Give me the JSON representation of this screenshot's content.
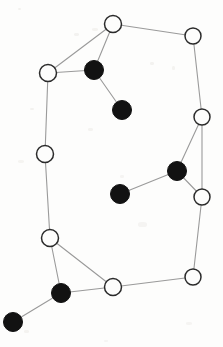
{
  "figure": {
    "title": "",
    "width": 223,
    "height": 347,
    "background_color": "#fdfdfc",
    "node_open_fill": "#fdfdfc",
    "node_open_stroke": "#2b2b2b",
    "node_filled_fill": "#121212",
    "edge_color": "#9a9a9a"
  },
  "chart_data": {
    "type": "scatter",
    "title": "",
    "subtitle": "",
    "xlabel": "",
    "ylabel": "",
    "xlim": [
      0,
      223
    ],
    "ylim": [
      0,
      347
    ],
    "grid": false,
    "legend": [
      {
        "key": "open",
        "label": "",
        "marker": "open-circle",
        "color": "#fdfdfc"
      },
      {
        "key": "filled",
        "label": "",
        "marker": "filled-circle",
        "color": "#121212"
      }
    ],
    "annotations": [],
    "nodes": [
      {
        "id": "n1",
        "label": "",
        "x": 113,
        "y": 24,
        "r": 8.5,
        "type": "open"
      },
      {
        "id": "n2",
        "label": "",
        "x": 193,
        "y": 36,
        "r": 8.0,
        "type": "open"
      },
      {
        "id": "n3",
        "label": "",
        "x": 48,
        "y": 73,
        "r": 8.5,
        "type": "open"
      },
      {
        "id": "n4",
        "label": "",
        "x": 94,
        "y": 70,
        "r": 9.5,
        "type": "filled"
      },
      {
        "id": "n5",
        "label": "",
        "x": 122,
        "y": 110,
        "r": 9.5,
        "type": "filled"
      },
      {
        "id": "n6",
        "label": "",
        "x": 202,
        "y": 117,
        "r": 8.0,
        "type": "open"
      },
      {
        "id": "n7",
        "label": "",
        "x": 45,
        "y": 154,
        "r": 8.5,
        "type": "open"
      },
      {
        "id": "n8",
        "label": "",
        "x": 177,
        "y": 171,
        "r": 9.5,
        "type": "filled"
      },
      {
        "id": "n9",
        "label": "",
        "x": 120,
        "y": 194,
        "r": 9.5,
        "type": "filled"
      },
      {
        "id": "n10",
        "label": "",
        "x": 202,
        "y": 197,
        "r": 8.0,
        "type": "open"
      },
      {
        "id": "n11",
        "label": "",
        "x": 50,
        "y": 238,
        "r": 8.5,
        "type": "open"
      },
      {
        "id": "n12",
        "label": "",
        "x": 193,
        "y": 277,
        "r": 8.0,
        "type": "open"
      },
      {
        "id": "n13",
        "label": "",
        "x": 113,
        "y": 287,
        "r": 8.5,
        "type": "open"
      },
      {
        "id": "n14",
        "label": "",
        "x": 61,
        "y": 293,
        "r": 9.5,
        "type": "filled"
      },
      {
        "id": "n15",
        "label": "",
        "x": 13,
        "y": 322,
        "r": 9.5,
        "type": "filled"
      }
    ],
    "edges": [
      {
        "source": "n1",
        "target": "n2"
      },
      {
        "source": "n1",
        "target": "n3"
      },
      {
        "source": "n1",
        "target": "n4"
      },
      {
        "source": "n3",
        "target": "n4"
      },
      {
        "source": "n4",
        "target": "n5"
      },
      {
        "source": "n2",
        "target": "n6"
      },
      {
        "source": "n3",
        "target": "n7"
      },
      {
        "source": "n6",
        "target": "n8"
      },
      {
        "source": "n6",
        "target": "n10"
      },
      {
        "source": "n8",
        "target": "n9"
      },
      {
        "source": "n8",
        "target": "n10"
      },
      {
        "source": "n7",
        "target": "n11"
      },
      {
        "source": "n10",
        "target": "n12"
      },
      {
        "source": "n11",
        "target": "n13"
      },
      {
        "source": "n11",
        "target": "n14"
      },
      {
        "source": "n12",
        "target": "n13"
      },
      {
        "source": "n13",
        "target": "n14"
      },
      {
        "source": "n14",
        "target": "n15"
      }
    ]
  }
}
